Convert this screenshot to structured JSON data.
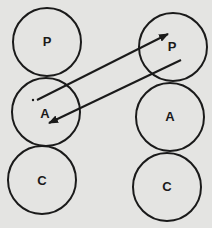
{
  "diagram": {
    "type": "two-column circle stack with crossing arrows",
    "columns": [
      {
        "id": "left",
        "circles": [
          {
            "label": "P",
            "cx": 47,
            "cy": 42,
            "r": 34
          },
          {
            "label": "A",
            "cx": 46,
            "cy": 112,
            "r": 34
          },
          {
            "label": "C",
            "cx": 42,
            "cy": 180,
            "r": 34
          }
        ]
      },
      {
        "id": "right",
        "circles": [
          {
            "label": "P",
            "cx": 173,
            "cy": 47,
            "r": 34
          },
          {
            "label": "A",
            "cx": 170,
            "cy": 117,
            "r": 34
          },
          {
            "label": "C",
            "cx": 167,
            "cy": 187,
            "r": 34
          }
        ]
      }
    ],
    "arrows": [
      {
        "from": "left A",
        "to": "right P",
        "x1": 36,
        "y1": 100,
        "x2": 168,
        "y2": 34
      },
      {
        "from": "right P",
        "to": "left A",
        "x1": 181,
        "y1": 60,
        "x2": 49,
        "y2": 123
      }
    ],
    "colors": {
      "background": "#e4e4e2",
      "ink": "#1a1a1a"
    }
  }
}
